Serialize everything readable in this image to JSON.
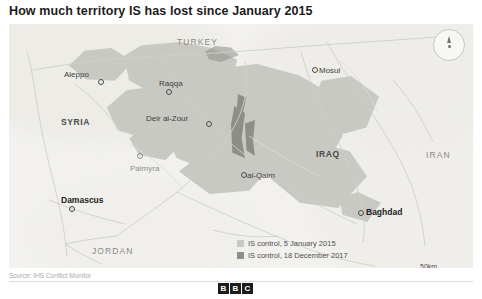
{
  "headline": "How much territory IS has lost since January 2015",
  "compass": {
    "name": "north-arrow"
  },
  "map": {
    "countries": [
      {
        "label": "TURKEY",
        "style": "countrylight",
        "x": 168,
        "y": 14
      },
      {
        "label": "SYRIA",
        "style": "country",
        "x": 52,
        "y": 94
      },
      {
        "label": "IRAQ",
        "style": "country",
        "x": 307,
        "y": 126
      },
      {
        "label": "IRAN",
        "style": "countrylight",
        "x": 417,
        "y": 127
      },
      {
        "label": "JORDAN",
        "style": "countrylight",
        "x": 83,
        "y": 223
      }
    ],
    "cities": [
      {
        "label": "Aleppo",
        "style": "city",
        "lx": 55,
        "ly": 46,
        "dx": 89,
        "dy": 55
      },
      {
        "label": "Raqqa",
        "style": "city",
        "lx": 150,
        "ly": 55,
        "dx": 157,
        "dy": 65
      },
      {
        "label": "Mosul",
        "style": "city",
        "lx": 310,
        "ly": 42,
        "dx": 303,
        "dy": 43
      },
      {
        "label": "Deir al-Zour",
        "style": "city",
        "lx": 137,
        "ly": 90,
        "dx": 197,
        "dy": 97
      },
      {
        "label": "Palmyra",
        "style": "citygrey",
        "lx": 121,
        "ly": 140,
        "dx": 128,
        "dy": 129
      },
      {
        "label": "al-Qaim",
        "style": "city",
        "lx": 238,
        "ly": 147,
        "dx": 232,
        "dy": 148
      },
      {
        "label": "Damascus",
        "style": "citybold",
        "lx": 52,
        "ly": 172,
        "dx": 60,
        "dy": 182
      },
      {
        "label": "Baghdad",
        "style": "citybold",
        "lx": 357,
        "ly": 184,
        "dx": 349,
        "dy": 186
      }
    ]
  },
  "legend": {
    "items": [
      {
        "label": "IS control, 5 January 2015",
        "color": "#c9c9c4"
      },
      {
        "label": "IS control, 18 December 2017",
        "color": "#8e8e88"
      }
    ]
  },
  "scale": {
    "km": "50km",
    "miles": "50 miles"
  },
  "source": "Source: IHS Conflict Monitor",
  "brand": {
    "letters": [
      "B",
      "B",
      "C"
    ]
  }
}
